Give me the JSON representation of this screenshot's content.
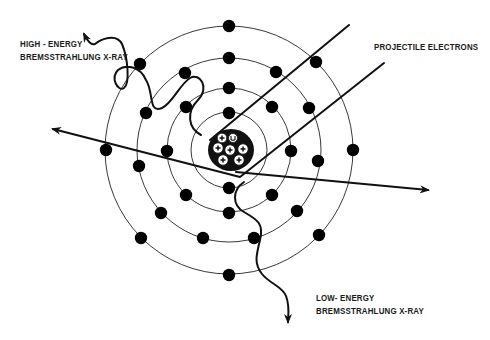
{
  "labels": {
    "high_energy_line1": "HIGH - ENERGY",
    "high_energy_line2": "BREMSSTRAHLUNG X-RAY",
    "projectile": "PROJECTILE ELECTRONS",
    "low_energy_line1": "LOW- ENERGY",
    "low_energy_line2": "BREMSSTRAHLUNG X-RAY"
  },
  "atom": {
    "center": [
      229,
      150
    ],
    "nucleus_radius": 22,
    "orbit_radii": [
      38,
      62,
      92,
      124
    ],
    "electron_symbol": "minus",
    "nucleus_symbols": [
      "plus",
      "neutron"
    ]
  },
  "colors": {
    "ink": "#111111",
    "background": "#ffffff"
  }
}
